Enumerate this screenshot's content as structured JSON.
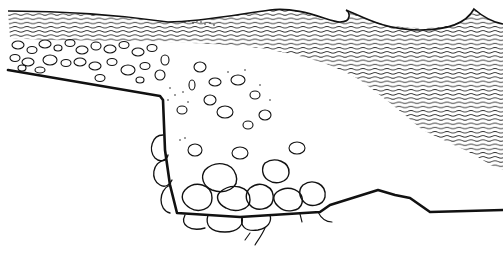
{
  "figure": {
    "type": "line-illustration",
    "background_color": "#ffffff",
    "ink_color": "#111111",
    "elements": [
      {
        "name": "wave-surface",
        "description": "wave crests breaking toward the right"
      },
      {
        "name": "water-hatching",
        "description": "horizontal wavy hatching representing water"
      },
      {
        "name": "rubble-layer",
        "description": "layer of pebbles and stones along the upper shelf"
      },
      {
        "name": "scattered-stones",
        "description": "stones dispersed into the water column"
      },
      {
        "name": "boulder-pile",
        "description": "large boulders resting at the bottom of the step"
      },
      {
        "name": "rock-face",
        "description": "vertical cliff with rounded blocks"
      },
      {
        "name": "seabed-line",
        "description": "bottom profile extending to the right"
      }
    ]
  }
}
